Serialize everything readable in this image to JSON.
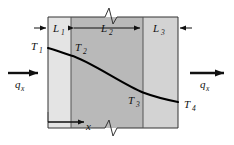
{
  "figure": {
    "layers": [
      {
        "id": "L1",
        "label": "L",
        "subscript": "1",
        "fill": "#e4e4e4"
      },
      {
        "id": "L2",
        "label": "L",
        "subscript": "2",
        "fill": "#b9b9b9"
      },
      {
        "id": "L3",
        "label": "L",
        "subscript": "3",
        "fill": "#d3d3d3"
      }
    ],
    "temperatures": [
      {
        "id": "T1",
        "label": "T",
        "subscript": "1"
      },
      {
        "id": "T2",
        "label": "T",
        "subscript": "2"
      },
      {
        "id": "T3",
        "label": "T",
        "subscript": "3"
      },
      {
        "id": "T4",
        "label": "T",
        "subscript": "4"
      }
    ],
    "heat_flux": [
      {
        "id": "qx-left",
        "label": "q",
        "subscript": "x"
      },
      {
        "id": "qx-right",
        "label": "q",
        "subscript": "x"
      }
    ],
    "axis": {
      "label": "x"
    },
    "colors": {
      "outline": "#333333",
      "curve": "#000000",
      "arrow": "#111111",
      "text": "#111111",
      "background": "#ffffff"
    }
  }
}
